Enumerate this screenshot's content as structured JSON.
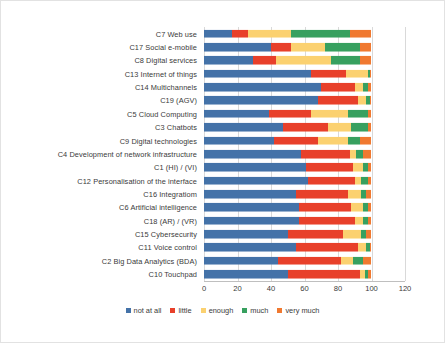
{
  "chart_data": {
    "type": "bar",
    "orientation": "horizontal",
    "stacked": true,
    "percent": true,
    "title": "",
    "xlabel": "",
    "ylabel": "",
    "xlim": [
      0,
      120
    ],
    "xticks": [
      0,
      20,
      40,
      60,
      80,
      100,
      120
    ],
    "grid": true,
    "legend_position": "bottom",
    "categories": [
      "C7 Web use",
      "C17 Social e-mobile",
      "C8 Digital services",
      "C13 Internet of things",
      "C14 Multichannels",
      "C19  (AGV)",
      "C5 Cloud Computing",
      "C3 Chatbots",
      "C9 Digital technologies",
      "C4 Development of network infrastructure",
      "C1 (HI) /  (VI)",
      "C12 Personalisation of the interface",
      "C16 Integratiom",
      "C6 Artificial intelligence",
      "C18 (AR) /  (VR)",
      "C15 Cybersecurity",
      "C11 Voice control",
      "C2 Big Data Analytics (BDA)",
      "C10 Touchpad"
    ],
    "series": [
      {
        "name": "not at all",
        "color": "#4472a8",
        "values": [
          17,
          40,
          29,
          64,
          70,
          68,
          39,
          47,
          42,
          58,
          61,
          62,
          55,
          57,
          57,
          50,
          55,
          44,
          50
        ]
      },
      {
        "name": "little",
        "color": "#e8402a",
        "values": [
          9,
          12,
          14,
          21,
          20,
          24,
          25,
          27,
          26,
          29,
          28,
          28,
          31,
          31,
          33,
          33,
          37,
          38,
          43
        ]
      },
      {
        "name": "enough",
        "color": "#fbd170",
        "values": [
          26,
          20,
          33,
          13,
          5,
          5,
          22,
          14,
          18,
          4,
          6,
          4,
          8,
          7,
          5,
          11,
          5,
          7,
          3
        ]
      },
      {
        "name": "much",
        "color": "#37a05f",
        "values": [
          35,
          21,
          17,
          1,
          3,
          2,
          12,
          10,
          7,
          4,
          3,
          4,
          3,
          3,
          3,
          3,
          2,
          6,
          2
        ]
      },
      {
        "name": "very much",
        "color": "#f07930",
        "values": [
          13,
          7,
          7,
          1,
          2,
          1,
          2,
          2,
          7,
          5,
          2,
          2,
          3,
          2,
          2,
          3,
          1,
          5,
          2
        ]
      }
    ]
  },
  "legend": {
    "items": [
      {
        "label": "not at all",
        "color": "#4472a8"
      },
      {
        "label": "little",
        "color": "#e8402a"
      },
      {
        "label": "enough",
        "color": "#fbd170"
      },
      {
        "label": "much",
        "color": "#37a05f"
      },
      {
        "label": "very much",
        "color": "#f07930"
      }
    ]
  }
}
